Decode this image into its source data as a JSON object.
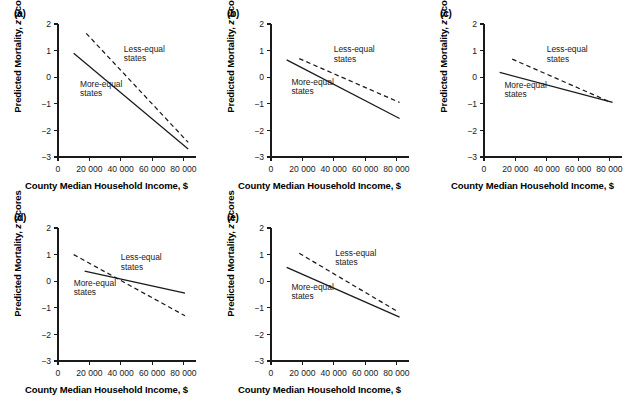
{
  "figure": {
    "panel_count": 5,
    "axis_labels": {
      "x": "County Median Household Income, $",
      "y_prefix": "Predicted Mortality, ",
      "y_italic": "z",
      "y_suffix": " Scores"
    },
    "series_labels": {
      "solid": "More-equal states",
      "dashed": "Less-equal states"
    },
    "colors": {
      "ink": "#1a1a1a",
      "background": "#ffffff"
    }
  },
  "chart_data": [
    {
      "type": "line",
      "panel": "(a)",
      "title": "",
      "xlabel": "County Median Household Income, $",
      "ylabel": "Predicted Mortality, z Scores",
      "xlim": [
        0,
        88000
      ],
      "ylim": [
        -3,
        2
      ],
      "xticks": [
        0,
        20000,
        40000,
        60000,
        80000
      ],
      "xticklabels": [
        "0",
        "20 000",
        "40 000",
        "60 000",
        "80 000"
      ],
      "yticks": [
        2,
        1,
        0,
        -1,
        -2,
        -3
      ],
      "yticklabels": [
        "2",
        "1",
        "0",
        "−1",
        "−2",
        "−3"
      ],
      "grid": false,
      "legend": "inline-annotation",
      "series": [
        {
          "name": "More-equal states",
          "style": "solid",
          "x": [
            10000,
            83000
          ],
          "values": [
            0.9,
            -2.7
          ],
          "label_x": 14000,
          "label_y": -0.35
        },
        {
          "name": "Less-equal states",
          "style": "dashed",
          "x": [
            18000,
            83000
          ],
          "values": [
            1.65,
            -2.45
          ],
          "label_x": 42000,
          "label_y": 0.95
        }
      ]
    },
    {
      "type": "line",
      "panel": "(b)",
      "title": "",
      "xlabel": "County Median Household Income, $",
      "ylabel": "Predicted Mortality, z Scores",
      "xlim": [
        0,
        88000
      ],
      "ylim": [
        -3,
        2
      ],
      "xticks": [
        0,
        20000,
        40000,
        60000,
        80000
      ],
      "xticklabels": [
        "0",
        "20 000",
        "40 000",
        "60 000",
        "80 000"
      ],
      "yticks": [
        2,
        1,
        0,
        -1,
        -2,
        -3
      ],
      "yticklabels": [
        "2",
        "1",
        "0",
        "−1",
        "−2",
        "−3"
      ],
      "grid": false,
      "legend": "inline-annotation",
      "series": [
        {
          "name": "More-equal states",
          "style": "solid",
          "x": [
            10000,
            82000
          ],
          "values": [
            0.65,
            -1.55
          ],
          "label_x": 13000,
          "label_y": -0.28
        },
        {
          "name": "Less-equal states",
          "style": "dashed",
          "x": [
            18000,
            82000
          ],
          "values": [
            0.7,
            -0.95
          ],
          "label_x": 40000,
          "label_y": 0.93
        }
      ]
    },
    {
      "type": "line",
      "panel": "(c)",
      "title": "",
      "xlabel": "County Median Household Income, $",
      "ylabel": "Predicted Mortality, z Scores",
      "xlim": [
        0,
        88000
      ],
      "ylim": [
        -3,
        2
      ],
      "xticks": [
        0,
        20000,
        40000,
        60000,
        80000
      ],
      "xticklabels": [
        "0",
        "20 000",
        "40 000",
        "60 000",
        "80 000"
      ],
      "yticks": [
        2,
        1,
        0,
        -1,
        -2,
        -3
      ],
      "yticklabels": [
        "2",
        "1",
        "0",
        "−1",
        "−2",
        "−3"
      ],
      "grid": false,
      "legend": "inline-annotation",
      "series": [
        {
          "name": "More-equal states",
          "style": "solid",
          "x": [
            10000,
            82000
          ],
          "values": [
            0.18,
            -0.95
          ],
          "label_x": 13000,
          "label_y": -0.4
        },
        {
          "name": "Less-equal states",
          "style": "dashed",
          "x": [
            18000,
            80000
          ],
          "values": [
            0.68,
            -0.92
          ],
          "label_x": 40000,
          "label_y": 0.93
        }
      ]
    },
    {
      "type": "line",
      "panel": "(d)",
      "title": "",
      "xlabel": "County Median Household Income, $",
      "ylabel": "Predicted Mortality, z Scores",
      "xlim": [
        0,
        88000
      ],
      "ylim": [
        -3,
        2
      ],
      "xticks": [
        0,
        20000,
        40000,
        60000,
        80000
      ],
      "xticklabels": [
        "0",
        "20 000",
        "40 000",
        "60 000",
        "80 000"
      ],
      "yticks": [
        2,
        1,
        0,
        -1,
        -2,
        -3
      ],
      "yticklabels": [
        "2",
        "1",
        "0",
        "−1",
        "−2",
        "−3"
      ],
      "grid": false,
      "legend": "inline-annotation",
      "series": [
        {
          "name": "More-equal states",
          "style": "solid",
          "x": [
            17000,
            81000
          ],
          "values": [
            0.38,
            -0.45
          ],
          "label_x": 10000,
          "label_y": -0.18
        },
        {
          "name": "Less-equal states",
          "style": "dashed",
          "x": [
            10000,
            81000
          ],
          "values": [
            1.0,
            -1.3
          ],
          "label_x": 40000,
          "label_y": 0.78
        }
      ]
    },
    {
      "type": "line",
      "panel": "(e)",
      "title": "",
      "xlabel": "County Median Household Income, $",
      "ylabel": "Predicted Mortality, z Scores",
      "xlim": [
        0,
        88000
      ],
      "ylim": [
        -3,
        2
      ],
      "xticks": [
        0,
        20000,
        40000,
        60000,
        80000
      ],
      "xticklabels": [
        "0",
        "20 000",
        "40 000",
        "60 000",
        "80 000"
      ],
      "yticks": [
        2,
        1,
        0,
        -1,
        -2,
        -3
      ],
      "yticklabels": [
        "2",
        "1",
        "0",
        "−1",
        "−2",
        "−3"
      ],
      "grid": false,
      "legend": "inline-annotation",
      "series": [
        {
          "name": "More-equal states",
          "style": "solid",
          "x": [
            10000,
            82000
          ],
          "values": [
            0.52,
            -1.35
          ],
          "label_x": 13000,
          "label_y": -0.32
        },
        {
          "name": "Less-equal states",
          "style": "dashed",
          "x": [
            18000,
            81000
          ],
          "values": [
            1.05,
            -1.15
          ],
          "label_x": 41000,
          "label_y": 0.95
        }
      ]
    }
  ]
}
